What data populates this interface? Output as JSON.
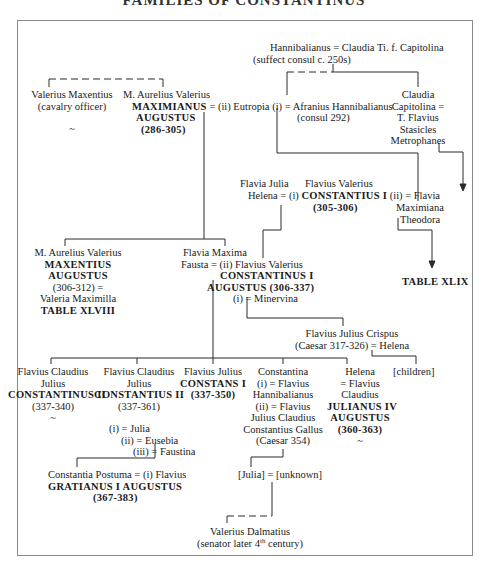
{
  "title": "FAMILIES OF CONSTANTINUS",
  "nodes": {
    "hannibalianus": {
      "line1": "Hannibalianus = Claudia Ti. f. Capitolina",
      "line2": "(suffect consul c. 250s)"
    },
    "valerius_maxentius": {
      "line1": "Valerius Maxentius",
      "line2": "(cavalry officer)",
      "line3": "~"
    },
    "maximianus": {
      "line1": "M. Aurelius Valerius",
      "line2": "MAXIMIANUS",
      "eq": " = (ii) Eutropia (i) = Afranius Hannibalianus",
      "line3": "AUGUSTUS",
      "line4": "(286-305)",
      "consul": "(consul 292)"
    },
    "claudia_capitolina": {
      "line1": "Claudia",
      "line2": "Capitolina =",
      "line3": "T. Flavius",
      "line4": "Stasicles",
      "line5": "Metrophanes"
    },
    "constantius": {
      "left1": "Flavia Julia",
      "left2": "Helena = (i) ",
      "top": "Flavius Valerius",
      "name": "CONSTANTIUS I",
      "right": " (ii) = Flavia",
      "dates": "(305-306)",
      "r2": "Maximiana",
      "r3": "Theodora"
    },
    "maxentius": {
      "line1": "M. Aurelius Valerius",
      "line2": "MAXENTIUS",
      "line3": "AUGUSTUS",
      "line4": "(306-312) =",
      "line5": "Valeria Maximilla",
      "line6": "TABLE XLVIII"
    },
    "constantinus": {
      "line1": "Flavia Maxima",
      "line2": "Fausta = (ii) Flavius Valerius",
      "line3": "CONSTANTINUS I",
      "line4": "AUGUSTUS (306-337)",
      "line5": "(i) = Minervina"
    },
    "table_xlix": "TABLE XLIX",
    "crispus": {
      "line1": "Flavius Julius Crispus",
      "line2": "(Caesar 317-326) = Helena"
    },
    "children_row": [
      {
        "lines": [
          "Flavius Claudius",
          "Julius"
        ],
        "bold": [
          "CONSTANTINUS II"
        ],
        "after": [
          "(337-340)",
          "~"
        ]
      },
      {
        "lines": [
          "Flavius Claudius",
          "Julius"
        ],
        "bold": [
          "CONSTANTIUS II"
        ],
        "after": [
          "(337-361)",
          "(i) = Julia",
          "(ii) = Eusebia",
          "(iii) = Faustina"
        ]
      },
      {
        "lines": [
          "Flavius Julius"
        ],
        "bold": [
          "CONSTANS I",
          "(337-350)"
        ],
        "after": []
      },
      {
        "lines": [
          "Constantina",
          "(i) = Flavius",
          "Hannibalianus",
          "(ii) = Flavius",
          "Julius Claudius",
          "Constantius Gallus",
          "(Caesar 354)"
        ],
        "bold": [],
        "after": []
      },
      {
        "lines": [
          "Helena",
          "= Flavius",
          "Claudius"
        ],
        "bold": [
          "JULIANUS IV",
          "AUGUSTUS",
          "(360-363)"
        ],
        "after": [
          "~"
        ]
      },
      {
        "lines": [
          "[children]"
        ],
        "bold": [],
        "after": []
      }
    ],
    "gratianus": {
      "line1": "Constantia Postuma = (i) Flavius",
      "line2": "GRATIANUS I AUGUSTUS",
      "line3": "(367-383)"
    },
    "julia": "[Julia] = [unknown]",
    "dalmatius": {
      "line1": "Valerius Dalmatius",
      "line2_pre": "(senator later 4",
      "line2_sup": "th",
      "line2_post": " century)"
    }
  },
  "colors": {
    "line": "#2a2a2a",
    "frame": "#8a8a8a",
    "text": "#1a1a1a"
  }
}
